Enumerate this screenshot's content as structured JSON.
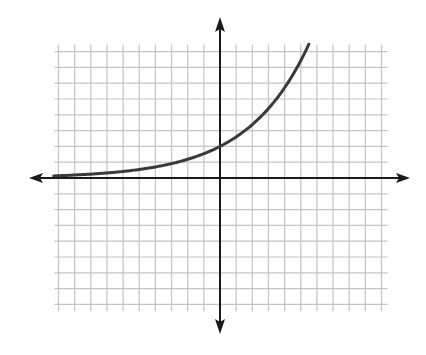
{
  "chart_data": {
    "type": "line",
    "title": "",
    "xlabel": "",
    "ylabel": "",
    "function": "y = 2 * 1.3^x (exponential growth)",
    "xlim": [
      -10,
      10
    ],
    "ylim": [
      -8,
      8
    ],
    "grid": true,
    "grid_step": 1,
    "axes_arrows": true,
    "series": [
      {
        "name": "exponential curve",
        "x": [
          -10.3,
          -8,
          -6,
          -4,
          -2,
          -1,
          0,
          1,
          2,
          3,
          4,
          5,
          5.5
        ],
        "y": [
          0.13,
          0.25,
          0.41,
          0.7,
          1.18,
          1.54,
          2.0,
          2.6,
          3.38,
          4.39,
          5.71,
          7.43,
          8.47
        ]
      }
    ],
    "y_intercept": 2,
    "horizontal_asymptote": 0
  },
  "colors": {
    "grid": "#c4c4c4",
    "axes": "#1a1a1a",
    "curve": "#3a3a3a",
    "background": "#ffffff"
  },
  "geometry": {
    "origin_px": [
      220,
      178
    ],
    "unit_px_x": 16.15,
    "unit_px_y": 15.8
  },
  "caption": ""
}
